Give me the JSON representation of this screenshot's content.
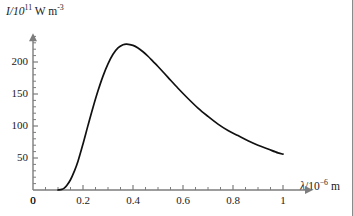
{
  "chart_data": {
    "type": "line",
    "title": "",
    "ylabel_text": "I/10",
    "ylabel_exp": "11",
    "ylabel_unit": " W m",
    "ylabel_unit_exp": "-3",
    "ylabel_full": "I/10^11 W m^-3",
    "xlabel_symbol": "λ",
    "xlabel_text": "/10",
    "xlabel_exp": "−6",
    "xlabel_unit": " m",
    "xlabel_full": "λ/10^−6 m",
    "xlim": [
      0,
      1.12
    ],
    "ylim": [
      0,
      245
    ],
    "xticks": [
      0,
      0.2,
      0.4,
      0.6,
      0.8,
      1
    ],
    "xtick_labels": [
      "0",
      "0.2",
      "0.4",
      "0.6",
      "0.8",
      "1"
    ],
    "yticks": [
      0,
      50,
      100,
      150,
      200
    ],
    "ytick_labels": [
      "0",
      "50",
      "100",
      "150",
      "200"
    ],
    "x_minor_step": 0.05,
    "y_minor_step": 10,
    "grid": false,
    "legend": null,
    "peak": {
      "x": 0.375,
      "y": 228
    },
    "series": [
      {
        "name": "spectral radiance",
        "color": "#111111",
        "x": [
          0.1,
          0.115,
          0.125,
          0.135,
          0.15,
          0.165,
          0.18,
          0.2,
          0.22,
          0.24,
          0.26,
          0.28,
          0.3,
          0.32,
          0.34,
          0.36,
          0.375,
          0.4,
          0.42,
          0.44,
          0.46,
          0.48,
          0.5,
          0.54,
          0.58,
          0.62,
          0.66,
          0.7,
          0.74,
          0.78,
          0.82,
          0.86,
          0.9,
          0.94,
          0.98,
          1.0
        ],
        "y": [
          0,
          1,
          3,
          7,
          16,
          29,
          45,
          72,
          101,
          129,
          155,
          178,
          197,
          212,
          222,
          227,
          228,
          226,
          222,
          216,
          209,
          201,
          193,
          176,
          159,
          143,
          128,
          115,
          103,
          93,
          85,
          77,
          70,
          64,
          58,
          56
        ]
      }
    ]
  },
  "axes": {
    "origin_px": {
      "x": 33,
      "y": 190
    },
    "x_scale_px_per_unit": 250,
    "y_scale_px_per_unit": 0.64,
    "axis_color": "#7d7d7d",
    "curve_color": "#111111"
  }
}
